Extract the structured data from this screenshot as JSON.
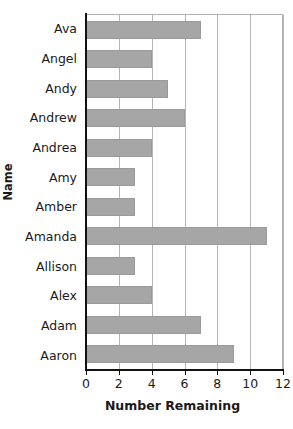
{
  "chart_data": {
    "type": "bar",
    "orientation": "horizontal",
    "title": "",
    "xlabel": "Number Remaining",
    "ylabel": "Name",
    "categories": [
      "Ava",
      "Angel",
      "Andy",
      "Andrew",
      "Andrea",
      "Amy",
      "Amber",
      "Amanda",
      "Allison",
      "Alex",
      "Adam",
      "Aaron"
    ],
    "values": [
      7,
      4,
      5,
      6,
      4,
      3,
      3,
      11,
      3,
      4,
      7,
      9
    ],
    "xlim": [
      0,
      12
    ],
    "xticks": [
      0,
      2,
      4,
      6,
      8,
      10,
      12
    ],
    "xtick_labels": [
      "0",
      "2",
      "4",
      "6",
      "8",
      "10",
      "12"
    ],
    "grid": "vertical",
    "legend": "none",
    "bar_color": "#a6a6a6",
    "axis_color": "#111111",
    "gridline_color": "#b5b5b5"
  }
}
